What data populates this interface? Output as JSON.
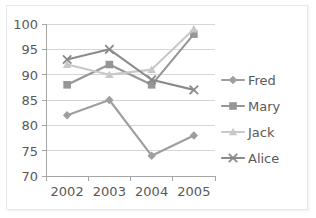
{
  "chart_data": {
    "type": "line",
    "title": "",
    "xlabel": "",
    "ylabel": "",
    "categories": [
      "2002",
      "2003",
      "2004",
      "2005"
    ],
    "ylim": [
      70,
      100
    ],
    "yticks": [
      70,
      75,
      80,
      85,
      90,
      95,
      100
    ],
    "ytick_labels": [
      "70",
      "75",
      "80",
      "85",
      "90",
      "95",
      "100"
    ],
    "grid": true,
    "legend_position": "right",
    "series": [
      {
        "name": "Fred",
        "values": [
          82,
          85,
          74,
          78
        ],
        "color": "#9e9e9e",
        "marker": "diamond"
      },
      {
        "name": "Mary",
        "values": [
          88,
          92,
          88,
          98
        ],
        "color": "#969696",
        "marker": "square"
      },
      {
        "name": "Jack",
        "values": [
          92,
          90,
          91,
          99
        ],
        "color": "#c8c8c8",
        "marker": "triangle"
      },
      {
        "name": "Alice",
        "values": [
          93,
          95,
          89,
          87
        ],
        "color": "#8a8a8a",
        "marker": "cross"
      }
    ]
  },
  "legend": {
    "items": [
      {
        "label": "Fred"
      },
      {
        "label": "Mary"
      },
      {
        "label": "Jack"
      },
      {
        "label": "Alice"
      }
    ]
  }
}
